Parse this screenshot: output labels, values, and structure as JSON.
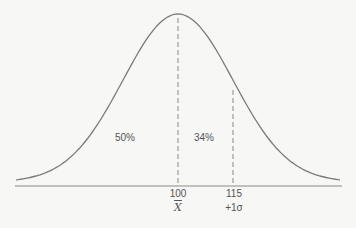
{
  "chart_data": {
    "type": "line",
    "title": "",
    "xlabel": "",
    "ylabel": "",
    "mean": 100,
    "sd": 15,
    "x_ticks": [
      {
        "value": 100,
        "label": "100",
        "sublabel": "X̄"
      },
      {
        "value": 115,
        "label": "115",
        "sublabel": "+1σ"
      }
    ],
    "regions": [
      {
        "label": "50%",
        "from": "-inf",
        "to": 100
      },
      {
        "label": "34%",
        "from": 100,
        "to": 115
      }
    ],
    "annotations": [
      "50%",
      "34%",
      "100",
      "X̄",
      "115",
      "+1σ"
    ],
    "grid": false,
    "legend": null
  },
  "labels": {
    "left_region": "50%",
    "mid_region": "34%",
    "mean_value": "100",
    "mean_symbol": "X",
    "sd_value": "115",
    "sd_symbol": "+1σ"
  },
  "colors": {
    "curve": "#7a7a7a",
    "axis": "#8a8a8a",
    "text": "#555555",
    "background": "#f7f7f5"
  }
}
